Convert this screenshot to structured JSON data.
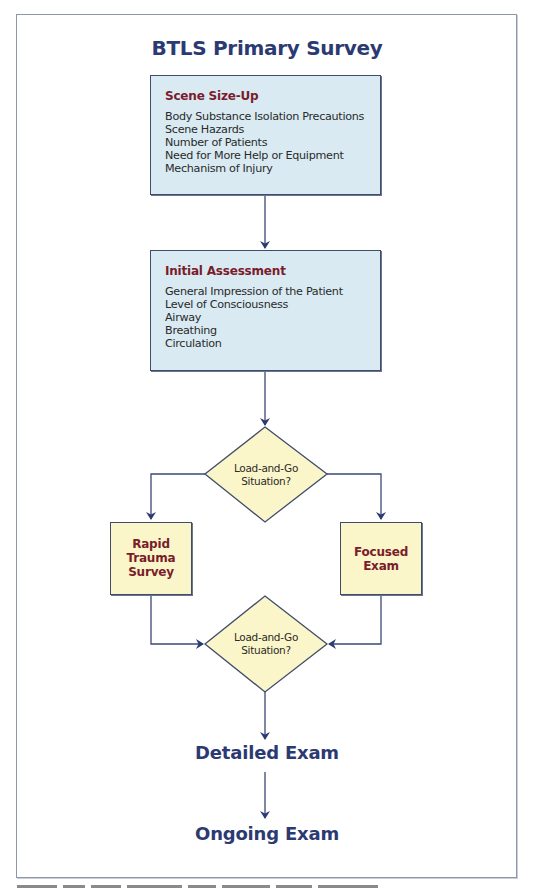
{
  "colors": {
    "navy": "#2b3a72",
    "maroon": "#7a1c2b",
    "blue_fill": "#d9eaf3",
    "yellow_fill": "#fbf6c9",
    "line": "#3a4a78",
    "frame_border": "#8e97a8"
  },
  "title": "BTLS Primary Survey",
  "scene_size_up": {
    "heading": "Scene Size-Up",
    "items": [
      "Body Substance Isolation Precautions",
      "Scene Hazards",
      "Number of Patients",
      "Need for More Help or Equipment",
      "Mechanism of Injury"
    ]
  },
  "initial_assessment": {
    "heading": "Initial Assessment",
    "items": [
      "General Impression of the Patient",
      "Level of Consciousness",
      "Airway",
      "Breathing",
      "Circulation"
    ]
  },
  "decision_1": {
    "lines": [
      "Load-and-Go",
      "Situation?"
    ]
  },
  "rapid_trauma_survey": {
    "lines": [
      "Rapid",
      "Trauma",
      "Survey"
    ]
  },
  "focused_exam": {
    "lines": [
      "Focused",
      "Exam"
    ]
  },
  "decision_2": {
    "lines": [
      "Load-and-Go",
      "Situation?"
    ]
  },
  "detailed_exam": "Detailed Exam",
  "ongoing_exam": "Ongoing Exam"
}
